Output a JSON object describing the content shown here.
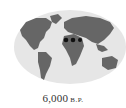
{
  "map": {
    "projection": "world-ellipse",
    "ocean_color": "#e6e6e6",
    "land_color": "#666666",
    "markers": [
      {
        "x": 66,
        "y": 40,
        "color": "#111111"
      },
      {
        "x": 73,
        "y": 40,
        "color": "#111111"
      },
      {
        "x": 80,
        "y": 40,
        "color": "#111111"
      }
    ]
  },
  "caption": {
    "year": "6,000",
    "era": "B.P."
  }
}
